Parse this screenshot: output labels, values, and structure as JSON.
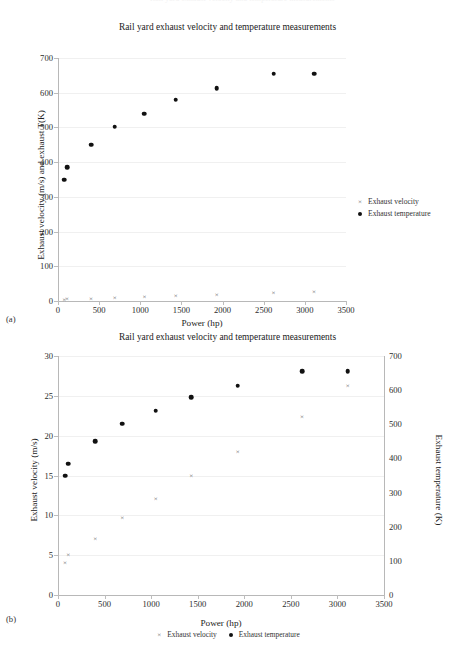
{
  "running_head": "Rail yard exhaust velocity and temperature measurements",
  "figures": [
    {
      "sublabel": "(a)",
      "title": "Rail yard exhaust velocity and temperature measurements"
    },
    {
      "sublabel": "(b)",
      "title": "Rail yard exhaust velocity and temperature measurements"
    }
  ],
  "legend": {
    "velocity_label": "Exhaust velocity",
    "temperature_label": "Exhaust temperature",
    "velocity_symbol": "×",
    "temperature_symbol": "●"
  },
  "chart_data": [
    {
      "type": "scatter",
      "id": "chart-a",
      "sublabel": "(a)",
      "title": "Rail yard exhaust velocity and temperature measurements",
      "xlabel": "Power (hp)",
      "ylabel": "Exhaust velocity (m/s) and exhaust T(K)",
      "xlim": [
        0,
        3500
      ],
      "ylim": [
        0,
        700
      ],
      "xticks": [
        0,
        500,
        1000,
        1500,
        2000,
        2500,
        3000,
        3500
      ],
      "yticks": [
        0,
        100,
        200,
        300,
        400,
        500,
        600,
        700
      ],
      "grid": "horizontal",
      "legend_position": "right",
      "x": [
        75,
        110,
        400,
        690,
        1050,
        1430,
        1930,
        2620,
        3110
      ],
      "series": [
        {
          "name": "Exhaust velocity",
          "marker": "x",
          "unit": "m/s",
          "values": [
            4,
            5,
            7,
            9.7,
            12,
            15,
            18,
            22.3,
            26.2
          ]
        },
        {
          "name": "Exhaust temperature",
          "marker": "dot",
          "unit": "K",
          "values": [
            350,
            385,
            450,
            502,
            540,
            580,
            613,
            655,
            655
          ]
        }
      ]
    },
    {
      "type": "scatter",
      "id": "chart-b",
      "sublabel": "(b)",
      "title": "Rail yard exhaust velocity and temperature measurements",
      "xlabel": "Power (hp)",
      "ylabel": "Exhaust velocity (m/s)",
      "y2label": "Exhaust temperature (K)",
      "xlim": [
        0,
        3500
      ],
      "ylim": [
        0,
        30
      ],
      "y2lim": [
        0,
        700
      ],
      "xticks": [
        0,
        500,
        1000,
        1500,
        2000,
        2500,
        3000,
        3500
      ],
      "yticks": [
        0,
        5,
        10,
        15,
        20,
        25,
        30
      ],
      "y2ticks": [
        0,
        100,
        200,
        300,
        400,
        500,
        600,
        700
      ],
      "grid": "horizontal",
      "legend_position": "bottom",
      "x": [
        75,
        110,
        400,
        690,
        1050,
        1430,
        1930,
        2620,
        3110
      ],
      "series": [
        {
          "name": "Exhaust velocity",
          "marker": "x",
          "axis": "left",
          "unit": "m/s",
          "values": [
            4,
            5,
            7,
            9.7,
            12,
            15,
            18,
            22.3,
            26.2
          ]
        },
        {
          "name": "Exhaust temperature",
          "marker": "dot",
          "axis": "right",
          "unit": "K",
          "values": [
            350,
            385,
            450,
            502,
            540,
            580,
            613,
            655,
            655
          ]
        }
      ]
    }
  ]
}
